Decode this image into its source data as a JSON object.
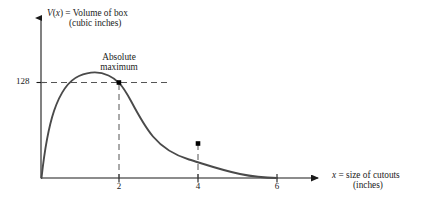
{
  "chart_data": {
    "type": "line",
    "title": "",
    "ylabel": "V(x)  =  Volume of box (cubic inches)",
    "ylabel_line1": "V(x)  =  Volume of box",
    "ylabel_line2": "(cubic inches)",
    "xlabel": "x  =  size of cutouts (inches)",
    "xlabel_line1": "x  =  size of cutouts",
    "xlabel_line2": "(inches)",
    "xlim": [
      0,
      7.2
    ],
    "ylim": [
      0,
      165
    ],
    "xticks": [
      "2",
      "4",
      "6"
    ],
    "xtick_values": [
      2,
      4,
      6
    ],
    "yticks": [
      "128"
    ],
    "ytick_values": [
      128
    ],
    "grid": false,
    "legend": null,
    "annotations": [
      {
        "text": "Absolute maximum",
        "line1": "Absolute",
        "line2": "maximum",
        "x": 2,
        "y": 128
      }
    ],
    "marked_points": [
      {
        "x": 2,
        "y": 128,
        "label": "absolute maximum"
      },
      {
        "x": 4,
        "y": 64,
        "label": "inflection point"
      }
    ],
    "dashed_guides": [
      {
        "orientation": "horizontal",
        "y": 128,
        "from_x": 0,
        "to_x": 3.65
      },
      {
        "orientation": "vertical",
        "x": 2,
        "from_y": 0,
        "to_y": 128
      },
      {
        "orientation": "vertical",
        "x": 4,
        "from_y": 0,
        "to_y": 64
      }
    ],
    "series": [
      {
        "name": "V(x) = x(12-2x)^2 / 4.5",
        "x": [
          0,
          0.1,
          0.2,
          0.3,
          0.4,
          0.5,
          0.6,
          0.7,
          0.8,
          0.9,
          1.0,
          1.1,
          1.2,
          1.3,
          1.4,
          1.5,
          1.6,
          1.7,
          1.8,
          1.9,
          2.0,
          2.1,
          2.2,
          2.3,
          2.4,
          2.5,
          2.6,
          2.7,
          2.8,
          2.9,
          3.0,
          3.1,
          3.2,
          3.3,
          3.4,
          3.5,
          3.6,
          3.7,
          3.8,
          3.9,
          4.0,
          4.1,
          4.2,
          4.3,
          4.4,
          4.5,
          4.6,
          4.7,
          4.8,
          4.9,
          5.0,
          5.1,
          5.2,
          5.3,
          5.4,
          5.5,
          5.6,
          5.7,
          5.8,
          5.9,
          6.0
        ],
        "y": [
          0,
          27.1,
          50.4,
          70.1,
          86.5,
          100.0,
          110.7,
          118.9,
          124.8,
          128.6,
          130.7,
          131.2,
          130.3,
          128.3,
          125.3,
          121.5,
          117.1,
          112.3,
          107.2,
          102.0,
          96.8,
          91.6,
          86.5,
          81.5,
          76.7,
          72.0,
          67.5,
          63.1,
          58.8,
          54.6,
          50.5,
          46.6,
          42.8,
          39.2,
          35.7,
          32.4,
          29.2,
          26.2,
          23.4,
          20.8,
          18.4,
          16.2,
          14.1,
          12.2,
          10.5,
          9.0,
          7.6,
          6.3,
          5.2,
          4.2,
          3.3,
          2.6,
          2.0,
          1.5,
          1.1,
          0.8,
          0.5,
          0.3,
          0.15,
          0.05,
          0
        ]
      }
    ],
    "colors": {
      "curve": "#4a4a4a",
      "axis": "#1a1a1a",
      "dashed": "#555555",
      "point": "#000000",
      "background": "#ffffff"
    }
  }
}
